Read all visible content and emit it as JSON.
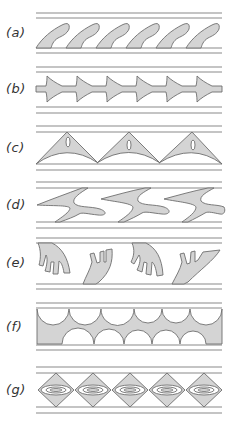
{
  "figure": {
    "panels": [
      {
        "id": "a",
        "label": "(a)",
        "description": "Row of six inclined hook-shaped blades attached to the lower wall"
      },
      {
        "id": "b",
        "label": "(b)",
        "description": "Central bar with six symmetric arrowhead/flared fins"
      },
      {
        "id": "c",
        "label": "(c)",
        "description": "Three triangular tented arches with curved bases and an oval slot each"
      },
      {
        "id": "d",
        "label": "(d)",
        "description": "Three S-shaped swept shapes spanning both walls"
      },
      {
        "id": "e",
        "label": "(e)",
        "description": "Alternating forked/finger-shaped blades from top and bottom walls"
      },
      {
        "id": "f",
        "label": "(f)",
        "description": "Filled band with scalloped semicircular cut-outs on top and bottom"
      },
      {
        "id": "g",
        "label": "(g)",
        "description": "Five diamonds, each with nested concentric ellipses"
      }
    ],
    "colors": {
      "fill": "#d4d4d4",
      "stroke": "#6e6e6e",
      "wall_line": "#8a8a8a",
      "background": "#ffffff"
    }
  }
}
